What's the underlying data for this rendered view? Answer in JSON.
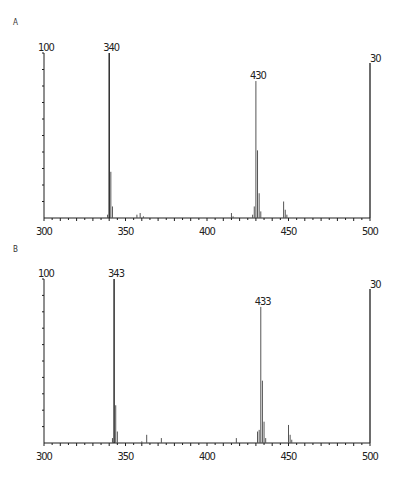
{
  "chart_data": [
    {
      "type": "bar",
      "panel_label": "A",
      "title": "",
      "xlabel": "",
      "ylabel": "",
      "xlim": [
        300,
        500
      ],
      "ylim": [
        0,
        100
      ],
      "left_axis_top_label": "100",
      "right_axis_top_label": "30",
      "x_tick_labels": [
        "300",
        "350",
        "400",
        "450",
        "500"
      ],
      "peak_labels": [
        {
          "x": 340,
          "text": "340"
        },
        {
          "x": 430,
          "text": "430"
        }
      ],
      "peaks": [
        {
          "x": 339,
          "y": 2
        },
        {
          "x": 340,
          "y": 100
        },
        {
          "x": 341,
          "y": 28
        },
        {
          "x": 342,
          "y": 7
        },
        {
          "x": 357,
          "y": 2
        },
        {
          "x": 359,
          "y": 3
        },
        {
          "x": 361,
          "y": 1
        },
        {
          "x": 415,
          "y": 3
        },
        {
          "x": 416,
          "y": 1
        },
        {
          "x": 428,
          "y": 2
        },
        {
          "x": 429,
          "y": 7
        },
        {
          "x": 430,
          "y": 83
        },
        {
          "x": 431,
          "y": 41
        },
        {
          "x": 432,
          "y": 15
        },
        {
          "x": 433,
          "y": 4
        },
        {
          "x": 447,
          "y": 10
        },
        {
          "x": 448,
          "y": 5
        },
        {
          "x": 449,
          "y": 2
        }
      ],
      "right_axis_note": "secondary scale full at 500 (labelled 30)"
    },
    {
      "type": "bar",
      "panel_label": "B",
      "title": "",
      "xlabel": "",
      "ylabel": "",
      "xlim": [
        300,
        500
      ],
      "ylim": [
        0,
        100
      ],
      "left_axis_top_label": "100",
      "right_axis_top_label": "30",
      "x_tick_labels": [
        "300",
        "350",
        "400",
        "450",
        "500"
      ],
      "peak_labels": [
        {
          "x": 343,
          "text": "343"
        },
        {
          "x": 433,
          "text": "433"
        }
      ],
      "peaks": [
        {
          "x": 342,
          "y": 3
        },
        {
          "x": 343,
          "y": 100
        },
        {
          "x": 344,
          "y": 23
        },
        {
          "x": 345,
          "y": 7
        },
        {
          "x": 360,
          "y": 1
        },
        {
          "x": 363,
          "y": 5
        },
        {
          "x": 372,
          "y": 3
        },
        {
          "x": 418,
          "y": 3
        },
        {
          "x": 431,
          "y": 7
        },
        {
          "x": 432,
          "y": 8
        },
        {
          "x": 433,
          "y": 83
        },
        {
          "x": 434,
          "y": 38
        },
        {
          "x": 435,
          "y": 13
        },
        {
          "x": 436,
          "y": 3
        },
        {
          "x": 450,
          "y": 11
        },
        {
          "x": 451,
          "y": 5
        },
        {
          "x": 452,
          "y": 2
        }
      ],
      "right_axis_note": "secondary scale full at 500 (labelled 30)"
    }
  ]
}
